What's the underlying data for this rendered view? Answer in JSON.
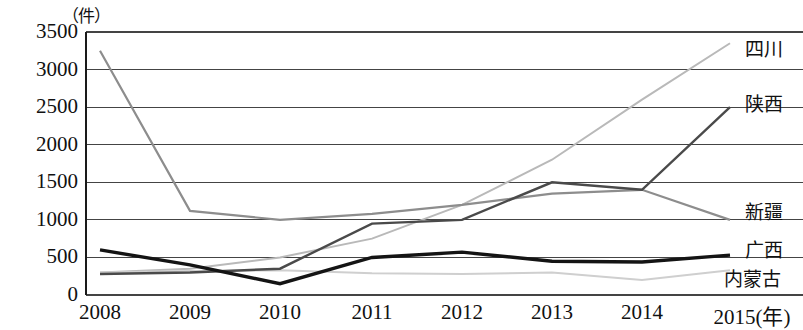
{
  "chart_data": {
    "type": "line",
    "title": "",
    "subtitle": "",
    "unit_label": "（件）",
    "xlabel": "(年)",
    "ylabel": "",
    "x_axis_suffix_label": "2015(年)",
    "categories": [
      "2008",
      "2009",
      "2010",
      "2011",
      "2012",
      "2013",
      "2014",
      "2015"
    ],
    "x_tick_labels": [
      "2008",
      "2009",
      "2010",
      "2011",
      "2012",
      "2013",
      "2014",
      "2015(年)"
    ],
    "y_tick_labels": [
      "3500",
      "3000",
      "2500",
      "2000",
      "1500",
      "1000",
      "500",
      "0"
    ],
    "y_ticks": [
      3500,
      3000,
      2500,
      2000,
      1500,
      1000,
      500,
      0
    ],
    "ylim": [
      0,
      3500
    ],
    "grid": true,
    "grid_axis": "y",
    "legend_position": "right-inline",
    "series": [
      {
        "name": "四川",
        "color": "#b9b9b9",
        "width": 2.0,
        "values": [
          300,
          350,
          500,
          750,
          1200,
          1800,
          2600,
          3350
        ]
      },
      {
        "name": "陕西",
        "color": "#4a4a4a",
        "width": 2.4,
        "values": [
          280,
          300,
          350,
          950,
          1000,
          1500,
          1400,
          2500
        ]
      },
      {
        "name": "新疆",
        "color": "#8d8d8d",
        "width": 2.2,
        "values": [
          3250,
          1120,
          1000,
          1080,
          1200,
          1350,
          1400,
          1000
        ]
      },
      {
        "name": "广西",
        "color": "#cfcfcf",
        "width": 2.0,
        "values": [
          300,
          320,
          330,
          290,
          280,
          300,
          200,
          330
        ]
      },
      {
        "name": "内蒙古",
        "color": "#141414",
        "width": 3.4,
        "values": [
          600,
          400,
          150,
          500,
          570,
          450,
          440,
          530
        ]
      }
    ],
    "legend_entries": [
      {
        "label": "四川",
        "x": 745,
        "y": 46
      },
      {
        "label": "陕西",
        "x": 745,
        "y": 101
      },
      {
        "label": "新疆",
        "x": 745,
        "y": 209
      },
      {
        "label": "广西",
        "x": 745,
        "y": 247
      },
      {
        "label": "内蒙古",
        "x": 724,
        "y": 276
      }
    ]
  },
  "axes": {
    "plot_left": 86,
    "plot_right": 803,
    "plot_top": 32,
    "plot_bottom": 295,
    "x_positions": [
      100,
      190,
      280,
      372,
      462,
      552,
      642,
      730
    ],
    "y_pixel_top": 32,
    "y_pixel_bottom": 295,
    "axis_color": "#1a1a1a",
    "grid_color": "#444444"
  }
}
